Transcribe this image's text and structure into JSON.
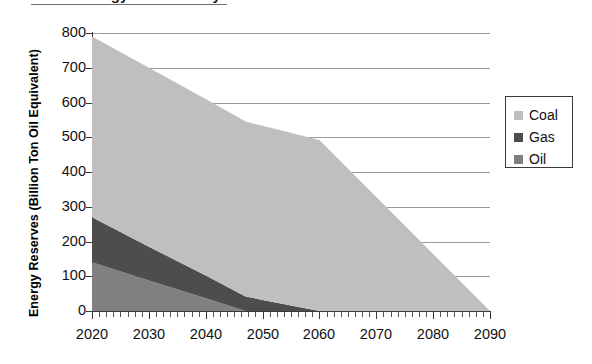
{
  "title": {
    "text": "World Energy Reserves by Fuel",
    "visible_fragment": "partially cropped at top edge"
  },
  "axes": {
    "ylabel": "Energy Reserves (Billion Ton Oil Equivalent)",
    "xlabel": "",
    "yticks": [
      "0",
      "100",
      "200",
      "300",
      "400",
      "500",
      "600",
      "700",
      "800"
    ],
    "xticks": [
      "2020",
      "2030",
      "2040",
      "2050",
      "2060",
      "2070",
      "2080",
      "2090"
    ]
  },
  "legend": {
    "position": "right",
    "items": [
      {
        "label": "Coal",
        "color": "#bfbfbf"
      },
      {
        "label": "Gas",
        "color": "#4d4d4d"
      },
      {
        "label": "Oil",
        "color": "#808080"
      }
    ]
  },
  "chart_data": {
    "type": "area",
    "stacked": true,
    "title": "World Energy Reserves by Fuel",
    "xlabel": "",
    "ylabel": "Energy Reserves (Billion Ton Oil Equivalent)",
    "xlim": [
      2020,
      2090
    ],
    "ylim": [
      0,
      800
    ],
    "ytick_step": 100,
    "xtick_step": 10,
    "minor_xtick_step": 1.25,
    "grid": "horizontal",
    "legend_position": "right",
    "x": [
      2020,
      2030,
      2040,
      2047,
      2050,
      2060,
      2070,
      2080,
      2090
    ],
    "series": [
      {
        "name": "Oil",
        "color": "#808080",
        "order": 1,
        "values": [
          140,
          88,
          37,
          0,
          0,
          0,
          0,
          0,
          0
        ],
        "exhausted_year": 2047
      },
      {
        "name": "Gas",
        "color": "#4d4d4d",
        "order": 2,
        "values": [
          130,
          97,
          65,
          42,
          32,
          0,
          0,
          0,
          0
        ],
        "exhausted_year": 2060
      },
      {
        "name": "Coal",
        "color": "#bfbfbf",
        "order": 3,
        "values": [
          520,
          515,
          508,
          503,
          501,
          492,
          328,
          164,
          0
        ],
        "exhausted_year": 2090
      }
    ],
    "stack_totals": [
      790,
      700,
      610,
      545,
      533,
      492,
      328,
      164,
      0
    ]
  },
  "colors": {
    "coal": "#bfbfbf",
    "gas": "#4d4d4d",
    "oil": "#808080",
    "gridline": "#9b9b9b",
    "axis": "#3a3a3a",
    "background": "#ffffff"
  }
}
